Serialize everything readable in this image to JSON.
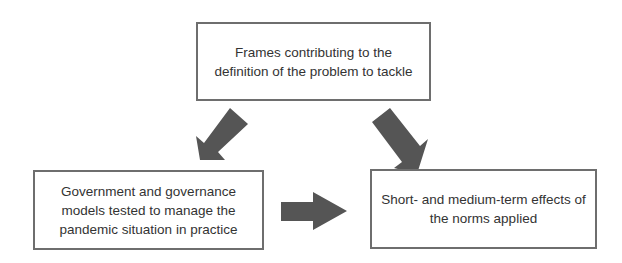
{
  "diagram": {
    "type": "flow",
    "boxes": {
      "top": {
        "lines": [
          "Frames contributing to the",
          "definition of the problem to tackle"
        ]
      },
      "left": {
        "lines": [
          "Government and governance",
          "models tested to manage the",
          "pandemic situation in practice"
        ]
      },
      "right": {
        "lines": [
          "Short- and medium-term effects of",
          "the norms applied"
        ]
      }
    },
    "arrows": [
      {
        "from": "top",
        "to": "left",
        "direction": "down-left"
      },
      {
        "from": "top",
        "to": "right",
        "direction": "down-right"
      },
      {
        "from": "left",
        "to": "right",
        "direction": "right"
      }
    ],
    "colors": {
      "arrow_fill": "#555555",
      "box_border": "#6e6e6e",
      "text": "#333333",
      "background": "#ffffff"
    }
  }
}
